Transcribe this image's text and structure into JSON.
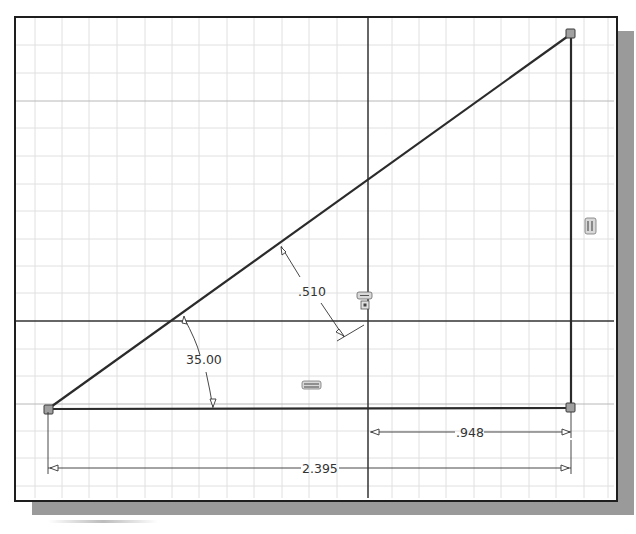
{
  "sketch": {
    "dimensions": {
      "angle": "35.00",
      "offset": ".510",
      "horizontal_short": ".948",
      "horizontal_overall": "2.395"
    },
    "icons": {
      "vertical_constraint": "vertical-constraint-icon",
      "horizontal_constraint": "horizontal-constraint-icon",
      "coincident_fix_constraint": "fix-constraint-icon"
    },
    "points": [
      {
        "name": "bottom-left-vertex",
        "x": 48,
        "y": 409
      },
      {
        "name": "top-right-vertex",
        "x": 571,
        "y": 34
      },
      {
        "name": "bottom-right-vertex",
        "x": 571,
        "y": 408
      }
    ],
    "colors": {
      "line": "#2b2b2b",
      "grid_minor": "#dcdcdc",
      "grid_major": "#bdbdbd",
      "axis": "#333333",
      "vertex": "#9a9a9a",
      "shadow": "#9a9a9a"
    }
  }
}
